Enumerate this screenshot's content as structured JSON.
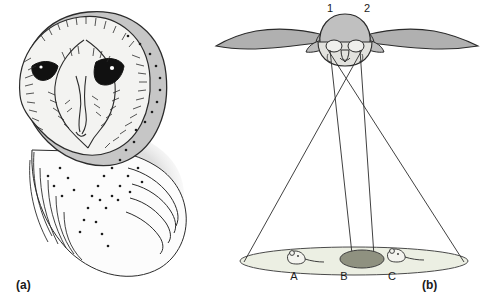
{
  "figure": {
    "width": 484,
    "height": 301,
    "background": "#ffffff",
    "caption_style": "two-panel biology figure"
  },
  "panels": [
    {
      "id": "a",
      "label": "(a)",
      "subject": "barn-owl-head",
      "description": "Line drawing of a barn owl head showing the heart-shaped facial disc, dark eyes and speckled plumage"
    },
    {
      "id": "b",
      "label": "(b)",
      "subject": "owl-sound-localization-diagram",
      "description": "Barn owl in flight seen from the front with lines from each ear converging on prey positions on the ground"
    }
  ],
  "diagram": {
    "ear_labels": [
      {
        "name": "ear-1",
        "text": "1"
      },
      {
        "name": "ear-2",
        "text": "2"
      }
    ],
    "target_labels": [
      {
        "name": "target-a",
        "text": "A"
      },
      {
        "name": "target-b",
        "text": "B"
      },
      {
        "name": "target-c",
        "text": "C"
      }
    ],
    "targets": [
      {
        "id": "A",
        "type": "mouse",
        "highlighted": false
      },
      {
        "id": "B",
        "type": "shaded-spot",
        "highlighted": true
      },
      {
        "id": "C",
        "type": "mouse",
        "highlighted": false
      }
    ],
    "ground_plane": "ellipse",
    "sight_lines": 4
  },
  "colors": {
    "line": "#2b2b2b",
    "owl_body_fill": "#b9b9b9",
    "owl_head_fill": "#c6c6c6",
    "facial_disc_fill": "#f2f2f0",
    "ground_fill": "#eceee4",
    "highlight_fill": "#8f9180",
    "text": "#1a1a1a",
    "background": "#ffffff"
  }
}
